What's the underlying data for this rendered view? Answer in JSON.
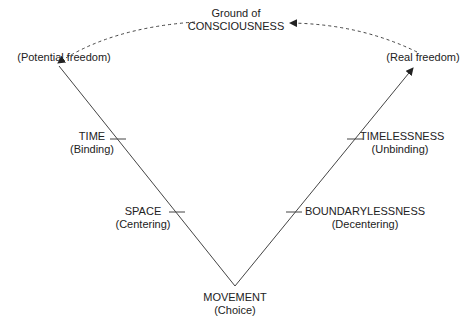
{
  "diagram": {
    "top": {
      "line1": "Ground of",
      "line2": "CONSCIOUSNESS"
    },
    "left_corner": "(Potential freedom)",
    "right_corner": "(Real freedom)",
    "left_side": [
      {
        "main": "TIME",
        "sub": "(Binding)"
      },
      {
        "main": "SPACE",
        "sub": "(Centering)"
      }
    ],
    "right_side": [
      {
        "main": "TIMELESSNESS",
        "sub": "(Unbinding)"
      },
      {
        "main": "BOUNDARYLESSNESS",
        "sub": "(Decentering)"
      }
    ],
    "bottom": {
      "main": "MOVEMENT",
      "sub": "(Choice)"
    },
    "colors": {
      "line": "#333333",
      "text": "#222222"
    }
  }
}
